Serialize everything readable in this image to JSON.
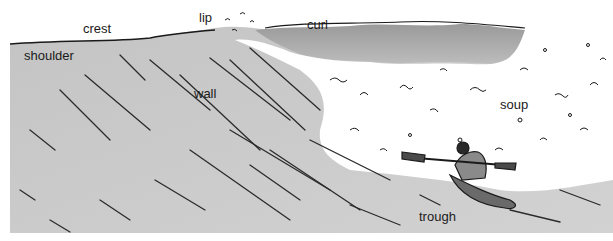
{
  "diagram": {
    "labels": {
      "crest": "crest",
      "lip": "lip",
      "curl": "curl",
      "shoulder": "shoulder",
      "wall": "wall",
      "soup": "soup",
      "trough": "trough"
    },
    "colors": {
      "wave_face": "#c8c8c8",
      "curl_shade": "#b0b0b0",
      "foam": "#ffffff",
      "ink": "#1a1a1a",
      "background": "#ffffff"
    }
  }
}
